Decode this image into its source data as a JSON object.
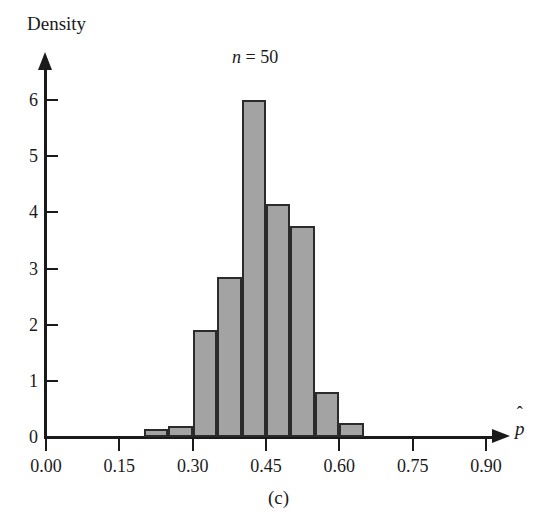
{
  "figure": {
    "caption": "(c)",
    "title": "n = 50",
    "title_symbol": "n",
    "title_rest": " = 50",
    "ylabel": "Density",
    "xlabel_base": "p",
    "xlabel_display": "p̂"
  },
  "colors": {
    "bar_fill": "#a3a3a3",
    "bar_stroke": "#2b2b2b",
    "axis": "#1a1a1a",
    "background": "#ffffff"
  },
  "chart_data": {
    "type": "bar",
    "subtype": "histogram",
    "title": "n = 50",
    "xlabel": "p̂",
    "ylabel": "Density",
    "xlim": [
      0.0,
      1.0
    ],
    "ylim": [
      0,
      6.5
    ],
    "grid": false,
    "legend": null,
    "bin_width": 0.05,
    "bin_edges": [
      0.2,
      0.25,
      0.3,
      0.35,
      0.4,
      0.45,
      0.5,
      0.55,
      0.6,
      0.65
    ],
    "categories": [
      "0.20-0.25",
      "0.25-0.30",
      "0.30-0.35",
      "0.35-0.40",
      "0.40-0.45",
      "0.45-0.50",
      "0.50-0.55",
      "0.55-0.60",
      "0.60-0.65"
    ],
    "values": [
      0.15,
      0.2,
      1.9,
      2.85,
      6.0,
      4.15,
      3.75,
      0.8,
      0.25
    ],
    "xticks": [
      {
        "value": 0.0,
        "label": "0.00"
      },
      {
        "value": 0.15,
        "label": "0.15"
      },
      {
        "value": 0.3,
        "label": "0.30"
      },
      {
        "value": 0.45,
        "label": "0.45"
      },
      {
        "value": 0.6,
        "label": "0.60"
      },
      {
        "value": 0.75,
        "label": "0.75"
      },
      {
        "value": 0.9,
        "label": "0.90"
      }
    ],
    "yticks": [
      {
        "value": 0,
        "label": "0"
      },
      {
        "value": 1,
        "label": "1"
      },
      {
        "value": 2,
        "label": "2"
      },
      {
        "value": 3,
        "label": "3"
      },
      {
        "value": 4,
        "label": "4"
      },
      {
        "value": 5,
        "label": "5"
      },
      {
        "value": 6,
        "label": "6"
      }
    ]
  }
}
